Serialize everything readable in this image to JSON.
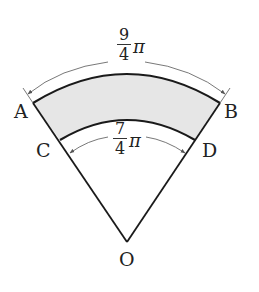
{
  "figure": {
    "type": "annular sector (shaded region ABDC between two concentric arcs centered at O)",
    "points": {
      "A": "A",
      "B": "B",
      "C": "C",
      "D": "D",
      "O": "O"
    },
    "outer_arc": {
      "label_numerator": "9",
      "label_denominator": "4",
      "label_symbol": "π",
      "value": "9/4 π",
      "endpoints": [
        "A",
        "B"
      ]
    },
    "inner_arc": {
      "label_numerator": "7",
      "label_denominator": "4",
      "label_symbol": "π",
      "value": "7/4 π",
      "endpoints": [
        "C",
        "D"
      ]
    },
    "colors": {
      "line": "#1a1a1a",
      "shaded_fill": "#e6e6e6",
      "dimension_line": "#555555",
      "background": "#ffffff"
    }
  }
}
